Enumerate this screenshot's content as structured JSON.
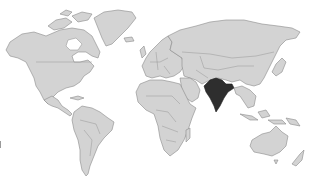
{
  "map": {
    "type": "world-choropleth",
    "projection": "equirectangular (Antarctica omitted)",
    "highlighted_region": "India",
    "colors": {
      "background": "#ffffff",
      "land": "#d3d3d3",
      "border": "#8a8a8a",
      "highlight": "#2e2e2e"
    },
    "regions": [
      {
        "name": "North America",
        "highlighted": false
      },
      {
        "name": "Greenland",
        "highlighted": false
      },
      {
        "name": "South America",
        "highlighted": false
      },
      {
        "name": "Europe",
        "highlighted": false
      },
      {
        "name": "Africa",
        "highlighted": false
      },
      {
        "name": "Russia / Asia",
        "highlighted": false
      },
      {
        "name": "India",
        "highlighted": true
      },
      {
        "name": "Southeast Asia",
        "highlighted": false
      },
      {
        "name": "Japan",
        "highlighted": false
      },
      {
        "name": "Australia",
        "highlighted": false
      },
      {
        "name": "New Zealand",
        "highlighted": false
      },
      {
        "name": "Madagascar",
        "highlighted": false
      }
    ]
  }
}
